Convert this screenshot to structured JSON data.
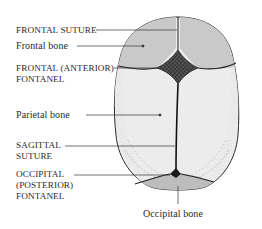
{
  "diagram": {
    "labels": {
      "frontal_suture": "FRONTAL SUTURE",
      "frontal_bone": "Frontal bone",
      "frontal_fontanel_line1": "FRONTAL (ANTERIOR)",
      "frontal_fontanel_line2": "FONTANEL",
      "parietal_bone": "Parietal bone",
      "sagittal_suture_line1": "SAGITTAL",
      "sagittal_suture_line2": "SUTURE",
      "occipital_fontanel_line1": "OCCIPITAL",
      "occipital_fontanel_line2": "(POSTERIOR)",
      "occipital_fontanel_line3": "FONTANEL",
      "occipital_bone": "Occipital bone"
    },
    "colors": {
      "bone_shade": "#c9c9c9",
      "parietal_fill": "#ececec",
      "outline": "#2b2b2b",
      "fontanel_fill": "#3a3a3a",
      "text": "#2a2a2a"
    }
  }
}
